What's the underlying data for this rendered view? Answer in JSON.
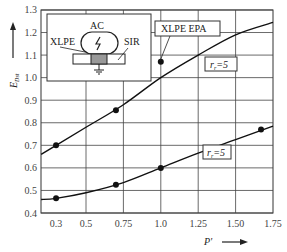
{
  "chart_data": {
    "type": "line",
    "title": "",
    "xlabel": "P'",
    "ylabel": "E_Dst",
    "xlim": [
      0.2,
      1.75
    ],
    "ylim": [
      0.4,
      1.3
    ],
    "x_ticks": [
      "0.3",
      "0.5",
      "0.75",
      "1.0",
      "1.25",
      "1.50",
      "1.75"
    ],
    "y_ticks": [
      "0.4",
      "0.5",
      "0.6",
      "0.7",
      "0.8",
      "0.9",
      "1.0",
      "1.1",
      "1.2",
      "1.3"
    ],
    "grid": true,
    "series": [
      {
        "name": "r_r=5 (upper)",
        "label": "r_r=5",
        "points": [
          [
            0.3,
            0.7
          ],
          [
            0.7,
            0.855
          ],
          [
            1.0,
            1.07
          ]
        ],
        "curve": [
          [
            0.2,
            0.66
          ],
          [
            0.3,
            0.7
          ],
          [
            0.5,
            0.78
          ],
          [
            0.75,
            0.88
          ],
          [
            1.0,
            1.0
          ],
          [
            1.25,
            1.1
          ],
          [
            1.5,
            1.19
          ],
          [
            1.75,
            1.245
          ]
        ]
      },
      {
        "name": "r_r=5 (lower)",
        "label": "r_r=5",
        "points": [
          [
            0.3,
            0.465
          ],
          [
            0.7,
            0.525
          ],
          [
            1.0,
            0.6
          ],
          [
            1.67,
            0.77
          ]
        ],
        "curve": [
          [
            0.2,
            0.46
          ],
          [
            0.3,
            0.465
          ],
          [
            0.5,
            0.49
          ],
          [
            0.75,
            0.535
          ],
          [
            1.0,
            0.6
          ],
          [
            1.25,
            0.665
          ],
          [
            1.5,
            0.725
          ],
          [
            1.75,
            0.785
          ]
        ]
      }
    ],
    "annotations": [
      {
        "text": "XLPE EPA",
        "points_to": [
          1.0,
          1.07
        ]
      },
      {
        "text": "r_r=5",
        "near_series": 0
      },
      {
        "text": "r_r=5",
        "near_series": 1
      }
    ],
    "inset": {
      "labels": {
        "top": "AC",
        "left": "XLPE",
        "right": "SIR"
      },
      "description": "electrode with lightning symbol over layered insulation, grounded center"
    }
  }
}
